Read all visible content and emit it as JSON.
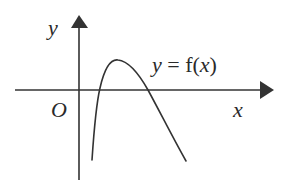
{
  "figure": {
    "type": "function-graph",
    "axis_labels": {
      "x": "x",
      "y": "y",
      "origin": "O"
    },
    "curve_label": {
      "lhs": "y",
      "eq": " = ",
      "fn": "f(",
      "arg": "x",
      "close": ")"
    },
    "colors": {
      "stroke": "#333333",
      "background": "#ffffff"
    },
    "curve_features": {
      "shape": "concave-down arch",
      "x_intercepts": 2,
      "maximum": "single local maximum above x-axis, right of y-axis",
      "left_end": "goes down steeply below x-axis near y-axis",
      "right_end": "decreases below x-axis"
    }
  }
}
